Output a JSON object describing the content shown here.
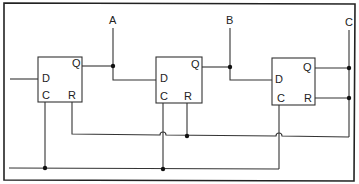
{
  "diagram": {
    "outputs": {
      "a": "A",
      "b": "B",
      "c": "C"
    },
    "flipflops": [
      {
        "id": "ff1",
        "pins": {
          "d": "D",
          "q": "Q",
          "c": "C",
          "r": "R"
        }
      },
      {
        "id": "ff2",
        "pins": {
          "d": "D",
          "q": "Q",
          "c": "C",
          "r": "R"
        }
      },
      {
        "id": "ff3",
        "pins": {
          "d": "D",
          "q": "Q",
          "c": "C",
          "r": "R"
        }
      }
    ],
    "colors": {
      "line": "#333333",
      "background": "#ffffff"
    }
  }
}
